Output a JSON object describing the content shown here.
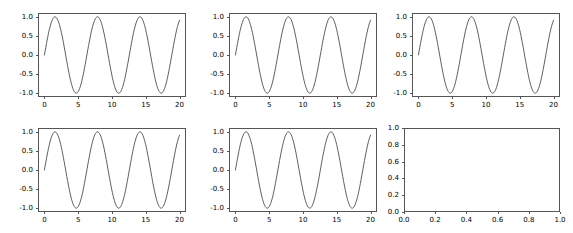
{
  "figure": {
    "width": 573,
    "height": 233,
    "facecolor": "#ffffff",
    "layout": "2 rows x 3 columns subplot grid",
    "line_color": "#4d4d4d",
    "spine_color": "#555555",
    "tick_label_color": "#000000"
  },
  "chart_data": [
    {
      "id": "subplot-r1c1",
      "type": "line",
      "title": "",
      "xlabel": "",
      "ylabel": "",
      "xlim": [
        -0.95,
        20.95
      ],
      "ylim": [
        -1.1,
        1.1
      ],
      "xticks": [
        0,
        5,
        10,
        15,
        20
      ],
      "xticklabels": [
        "0",
        "5",
        "10",
        "15",
        "20"
      ],
      "yticks": [
        -1.0,
        -0.5,
        0.0,
        0.5,
        1.0
      ],
      "yticklabels": [
        "-1.0",
        "-0.5",
        "0.0",
        "0.5",
        "1.0"
      ],
      "grid": false,
      "legend": null,
      "series": [
        {
          "name": "sin(x)",
          "function": "sin",
          "amplitude": 1.0,
          "period": 6.283185307179586,
          "phase": 0,
          "x_start": 0,
          "x_end": 20,
          "n_points": 200
        }
      ]
    },
    {
      "id": "subplot-r1c2",
      "type": "line",
      "title": "",
      "xlabel": "",
      "ylabel": "",
      "xlim": [
        -0.95,
        20.95
      ],
      "ylim": [
        -1.1,
        1.1
      ],
      "xticks": [
        0,
        5,
        10,
        15,
        20
      ],
      "xticklabels": [
        "0",
        "5",
        "10",
        "15",
        "20"
      ],
      "yticks": [
        -1.0,
        -0.5,
        0.0,
        0.5,
        1.0
      ],
      "yticklabels": [
        "-1.0",
        "-0.5",
        "0.0",
        "0.5",
        "1.0"
      ],
      "grid": false,
      "legend": null,
      "series": [
        {
          "name": "sin(x)",
          "function": "sin",
          "amplitude": 1.0,
          "period": 6.283185307179586,
          "phase": 0,
          "x_start": 0,
          "x_end": 20,
          "n_points": 200
        }
      ]
    },
    {
      "id": "subplot-r1c3",
      "type": "line",
      "title": "",
      "xlabel": "",
      "ylabel": "",
      "xlim": [
        -0.95,
        20.95
      ],
      "ylim": [
        -1.1,
        1.1
      ],
      "xticks": [
        0,
        5,
        10,
        15,
        20
      ],
      "xticklabels": [
        "0",
        "5",
        "10",
        "15",
        "20"
      ],
      "yticks": [
        -1.0,
        -0.5,
        0.0,
        0.5,
        1.0
      ],
      "yticklabels": [
        "-1.0",
        "-0.5",
        "0.0",
        "0.5",
        "1.0"
      ],
      "grid": false,
      "legend": null,
      "series": [
        {
          "name": "sin(x)",
          "function": "sin",
          "amplitude": 1.0,
          "period": 6.283185307179586,
          "phase": 0,
          "x_start": 0,
          "x_end": 20,
          "n_points": 200
        }
      ]
    },
    {
      "id": "subplot-r2c1",
      "type": "line",
      "title": "",
      "xlabel": "",
      "ylabel": "",
      "xlim": [
        -0.95,
        20.95
      ],
      "ylim": [
        -1.1,
        1.1
      ],
      "xticks": [
        0,
        5,
        10,
        15,
        20
      ],
      "xticklabels": [
        "0",
        "5",
        "10",
        "15",
        "20"
      ],
      "yticks": [
        -1.0,
        -0.5,
        0.0,
        0.5,
        1.0
      ],
      "yticklabels": [
        "-1.0",
        "-0.5",
        "0.0",
        "0.5",
        "1.0"
      ],
      "grid": false,
      "legend": null,
      "series": [
        {
          "name": "sin(x)",
          "function": "sin",
          "amplitude": 1.0,
          "period": 6.283185307179586,
          "phase": 0,
          "x_start": 0,
          "x_end": 20,
          "n_points": 200
        }
      ]
    },
    {
      "id": "subplot-r2c2",
      "type": "line",
      "title": "",
      "xlabel": "",
      "ylabel": "",
      "xlim": [
        -0.95,
        20.95
      ],
      "ylim": [
        -1.1,
        1.1
      ],
      "xticks": [
        0,
        5,
        10,
        15,
        20
      ],
      "xticklabels": [
        "0",
        "5",
        "10",
        "15",
        "20"
      ],
      "yticks": [
        -1.0,
        -0.5,
        0.0,
        0.5,
        1.0
      ],
      "yticklabels": [
        "-1.0",
        "-0.5",
        "0.0",
        "0.5",
        "1.0"
      ],
      "grid": false,
      "legend": null,
      "series": [
        {
          "name": "sin(x)",
          "function": "sin",
          "amplitude": 1.0,
          "period": 6.283185307179586,
          "phase": 0,
          "x_start": 0,
          "x_end": 20,
          "n_points": 200
        }
      ]
    },
    {
      "id": "subplot-r2c3",
      "type": "line",
      "title": "",
      "xlabel": "",
      "ylabel": "",
      "xlim": [
        0.0,
        1.0
      ],
      "ylim": [
        0.0,
        1.0
      ],
      "xticks": [
        0.0,
        0.2,
        0.4,
        0.6,
        0.8,
        1.0
      ],
      "xticklabels": [
        "0.0",
        "0.2",
        "0.4",
        "0.6",
        "0.8",
        "1.0"
      ],
      "yticks": [
        0.0,
        0.2,
        0.4,
        0.6,
        0.8,
        1.0
      ],
      "yticklabels": [
        "0.0",
        "0.2",
        "0.4",
        "0.6",
        "0.8",
        "1.0"
      ],
      "grid": false,
      "legend": null,
      "series": [],
      "note": "empty axes - no data plotted"
    }
  ]
}
